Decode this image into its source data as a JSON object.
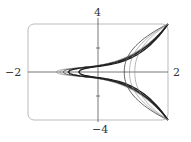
{
  "chart_data": {
    "type": "line",
    "title": "",
    "xlabel": "",
    "ylabel": "",
    "xlim": [
      -2,
      2
    ],
    "ylim": [
      -4,
      4
    ],
    "grid": false,
    "tick_labels": {
      "x_min": "−2",
      "x_max": "2",
      "y_max": "4",
      "y_min": "−4"
    },
    "y_ticks": [
      -2,
      2
    ],
    "series": [
      {
        "name": "curve-1",
        "vertex_x": -1.2,
        "weight": "thin"
      },
      {
        "name": "curve-2",
        "vertex_x": -1.1,
        "weight": "thin"
      },
      {
        "name": "curve-3",
        "vertex_x": -1.0,
        "weight": "medium"
      },
      {
        "name": "curve-4",
        "vertex_x": -0.85,
        "weight": "thick"
      },
      {
        "name": "curve-5",
        "vertex_x": -0.55,
        "weight": "thick"
      },
      {
        "name": "curve-6",
        "vertex_x": 0.75,
        "weight": "medium",
        "side": "right"
      },
      {
        "name": "curve-7",
        "vertex_x": 0.9,
        "weight": "thin",
        "side": "right"
      },
      {
        "name": "curve-8",
        "vertex_x": 1.05,
        "weight": "thin",
        "side": "right"
      }
    ]
  },
  "labels": {
    "y_top": "4",
    "y_bottom": "−4",
    "x_left": "−2",
    "x_right": "2"
  }
}
